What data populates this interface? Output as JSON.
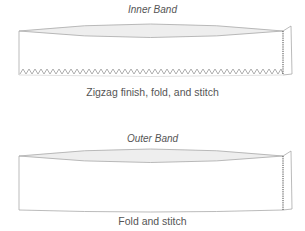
{
  "diagram": {
    "inner_band": {
      "title": "Inner Band",
      "caption": "Zigzag finish, fold, and stitch",
      "edge_finish": "zigzag",
      "seam": "stitched"
    },
    "outer_band": {
      "title": "Outer Band",
      "caption": "Fold and stitch",
      "edge_finish": "plain",
      "seam": "stitched"
    },
    "colors": {
      "line": "#aaaaaa",
      "fill_inside": "#eeeeee",
      "seam": "#444444",
      "text": "#555555"
    }
  }
}
